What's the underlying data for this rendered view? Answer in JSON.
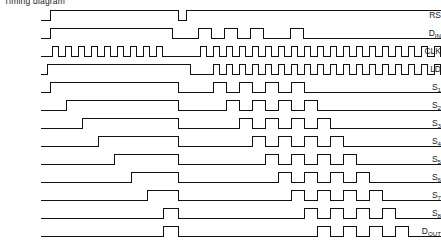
{
  "figure": {
    "caption": "Timing diagram",
    "width": 441,
    "height": 249,
    "stroke_color": "#111111",
    "background_color": "#ffffff"
  },
  "axis": {
    "plot_left": 41,
    "plot_right": 441,
    "row_height": 18,
    "wave_high": 4,
    "wave_low": 14,
    "clock_period": 13.1,
    "phase2_start": 178
  },
  "chart_data": {
    "type": "line",
    "title": "Timing diagram",
    "xlabel": "",
    "ylabel": "",
    "legend_position": "left-labels",
    "grid": false,
    "xlim": [
      41,
      441
    ],
    "ylim": [
      0,
      1
    ],
    "note": "Digital logic timing waveforms. Each series is a binary signal sampled as (x_pixel, level) transition pairs; level 1 = high, 0 = low.",
    "series": [
      {
        "name": "RS",
        "label": "RS",
        "overbar": true,
        "row": 0,
        "start_level": 0,
        "transitions": [
          [
            50,
            1
          ],
          [
            178,
            0
          ],
          [
            186,
            1
          ],
          [
            441,
            1
          ]
        ]
      },
      {
        "name": "D_IN",
        "label": "D",
        "sub": "IN",
        "overbar": false,
        "row": 1,
        "start_level": 0,
        "transitions": [
          [
            50,
            1
          ],
          [
            172,
            0
          ],
          [
            198,
            1
          ],
          [
            211,
            0
          ],
          [
            224,
            1
          ],
          [
            237,
            0
          ],
          [
            250,
            1
          ],
          [
            263,
            0
          ],
          [
            290,
            1
          ],
          [
            303,
            0
          ],
          [
            441,
            0
          ]
        ]
      },
      {
        "name": "CLK",
        "label": "CLK",
        "overbar": false,
        "row": 2,
        "start_level": 0,
        "transitions": [
          [
            52,
            1
          ],
          [
            58,
            0
          ],
          [
            65,
            1
          ],
          [
            71,
            0
          ],
          [
            78,
            1
          ],
          [
            84,
            0
          ],
          [
            91,
            1
          ],
          [
            97,
            0
          ],
          [
            104,
            1
          ],
          [
            110,
            0
          ],
          [
            117,
            1
          ],
          [
            123,
            0
          ],
          [
            130,
            1
          ],
          [
            136,
            0
          ],
          [
            143,
            1
          ],
          [
            149,
            0
          ],
          [
            156,
            1
          ],
          [
            162,
            0
          ],
          [
            200,
            1
          ],
          [
            206,
            0
          ],
          [
            213,
            1
          ],
          [
            219,
            0
          ],
          [
            226,
            1
          ],
          [
            232,
            0
          ],
          [
            239,
            1
          ],
          [
            245,
            0
          ],
          [
            252,
            1
          ],
          [
            258,
            0
          ],
          [
            265,
            1
          ],
          [
            271,
            0
          ],
          [
            278,
            1
          ],
          [
            284,
            0
          ],
          [
            291,
            1
          ],
          [
            297,
            0
          ],
          [
            304,
            1
          ],
          [
            310,
            0
          ],
          [
            317,
            1
          ],
          [
            323,
            0
          ],
          [
            330,
            1
          ],
          [
            336,
            0
          ],
          [
            343,
            1
          ],
          [
            349,
            0
          ],
          [
            356,
            1
          ],
          [
            362,
            0
          ],
          [
            369,
            1
          ],
          [
            375,
            0
          ],
          [
            382,
            1
          ],
          [
            388,
            0
          ],
          [
            395,
            1
          ],
          [
            401,
            0
          ],
          [
            408,
            1
          ],
          [
            414,
            0
          ],
          [
            421,
            1
          ],
          [
            427,
            0
          ],
          [
            434,
            1
          ],
          [
            440,
            0
          ],
          [
            441,
            0
          ]
        ]
      },
      {
        "name": "LD",
        "label": "LD",
        "overbar": false,
        "row": 3,
        "start_level": 0,
        "transitions": [
          [
            47,
            1
          ],
          [
            190,
            0
          ],
          [
            213,
            1
          ],
          [
            219,
            0
          ],
          [
            226,
            1
          ],
          [
            232,
            0
          ],
          [
            239,
            1
          ],
          [
            245,
            0
          ],
          [
            252,
            1
          ],
          [
            258,
            0
          ],
          [
            265,
            1
          ],
          [
            271,
            0
          ],
          [
            278,
            1
          ],
          [
            284,
            0
          ],
          [
            291,
            1
          ],
          [
            297,
            0
          ],
          [
            304,
            1
          ],
          [
            310,
            0
          ],
          [
            317,
            1
          ],
          [
            323,
            0
          ],
          [
            330,
            1
          ],
          [
            336,
            0
          ],
          [
            343,
            1
          ],
          [
            349,
            0
          ],
          [
            356,
            1
          ],
          [
            362,
            0
          ],
          [
            369,
            1
          ],
          [
            375,
            0
          ],
          [
            382,
            1
          ],
          [
            388,
            0
          ],
          [
            395,
            1
          ],
          [
            401,
            0
          ],
          [
            408,
            1
          ],
          [
            414,
            0
          ],
          [
            421,
            1
          ],
          [
            427,
            0
          ],
          [
            434,
            1
          ],
          [
            440,
            0
          ],
          [
            441,
            0
          ]
        ]
      },
      {
        "name": "S1",
        "label": "S",
        "sub": "1",
        "overbar": false,
        "row": 4,
        "start_level": 0,
        "transitions": [
          [
            50,
            1
          ],
          [
            178,
            0
          ],
          [
            213,
            1
          ],
          [
            226,
            0
          ],
          [
            239,
            1
          ],
          [
            252,
            0
          ],
          [
            265,
            1
          ],
          [
            278,
            0
          ],
          [
            291,
            1
          ],
          [
            304,
            0
          ],
          [
            441,
            0
          ]
        ]
      },
      {
        "name": "S2",
        "label": "S",
        "sub": "2",
        "overbar": false,
        "row": 5,
        "start_level": 0,
        "transitions": [
          [
            66,
            1
          ],
          [
            178,
            0
          ],
          [
            226,
            1
          ],
          [
            239,
            0
          ],
          [
            252,
            1
          ],
          [
            265,
            0
          ],
          [
            278,
            1
          ],
          [
            291,
            0
          ],
          [
            304,
            1
          ],
          [
            317,
            0
          ],
          [
            441,
            0
          ]
        ]
      },
      {
        "name": "S3",
        "label": "S",
        "sub": "3",
        "overbar": false,
        "row": 6,
        "start_level": 0,
        "transitions": [
          [
            82,
            1
          ],
          [
            178,
            0
          ],
          [
            239,
            1
          ],
          [
            252,
            0
          ],
          [
            265,
            1
          ],
          [
            278,
            0
          ],
          [
            291,
            1
          ],
          [
            304,
            0
          ],
          [
            317,
            1
          ],
          [
            330,
            0
          ],
          [
            441,
            0
          ]
        ]
      },
      {
        "name": "S4",
        "label": "S",
        "sub": "4",
        "overbar": false,
        "row": 7,
        "start_level": 0,
        "transitions": [
          [
            98,
            1
          ],
          [
            178,
            0
          ],
          [
            252,
            1
          ],
          [
            265,
            0
          ],
          [
            278,
            1
          ],
          [
            291,
            0
          ],
          [
            304,
            1
          ],
          [
            317,
            0
          ],
          [
            330,
            1
          ],
          [
            343,
            0
          ],
          [
            441,
            0
          ]
        ]
      },
      {
        "name": "S5",
        "label": "S",
        "sub": "5",
        "overbar": false,
        "row": 8,
        "start_level": 0,
        "transitions": [
          [
            114,
            1
          ],
          [
            178,
            0
          ],
          [
            265,
            1
          ],
          [
            278,
            0
          ],
          [
            291,
            1
          ],
          [
            304,
            0
          ],
          [
            317,
            1
          ],
          [
            330,
            0
          ],
          [
            343,
            1
          ],
          [
            356,
            0
          ],
          [
            441,
            0
          ]
        ]
      },
      {
        "name": "S6",
        "label": "S",
        "sub": "6",
        "overbar": false,
        "row": 9,
        "start_level": 0,
        "transitions": [
          [
            131,
            1
          ],
          [
            178,
            0
          ],
          [
            278,
            1
          ],
          [
            291,
            0
          ],
          [
            304,
            1
          ],
          [
            317,
            0
          ],
          [
            330,
            1
          ],
          [
            343,
            0
          ],
          [
            356,
            1
          ],
          [
            369,
            0
          ],
          [
            441,
            0
          ]
        ]
      },
      {
        "name": "S7",
        "label": "S",
        "sub": "7",
        "overbar": false,
        "row": 10,
        "start_level": 0,
        "transitions": [
          [
            147,
            1
          ],
          [
            178,
            0
          ],
          [
            291,
            1
          ],
          [
            304,
            0
          ],
          [
            317,
            1
          ],
          [
            330,
            0
          ],
          [
            343,
            1
          ],
          [
            356,
            0
          ],
          [
            369,
            1
          ],
          [
            382,
            0
          ],
          [
            441,
            0
          ]
        ]
      },
      {
        "name": "S8",
        "label": "S",
        "sub": "8",
        "overbar": false,
        "row": 11,
        "start_level": 0,
        "transitions": [
          [
            163,
            1
          ],
          [
            178,
            0
          ],
          [
            304,
            1
          ],
          [
            317,
            0
          ],
          [
            330,
            1
          ],
          [
            343,
            0
          ],
          [
            356,
            1
          ],
          [
            369,
            0
          ],
          [
            382,
            1
          ],
          [
            395,
            0
          ],
          [
            441,
            0
          ]
        ]
      },
      {
        "name": "D_OUT",
        "label": "D",
        "sub": "OUT",
        "overbar": false,
        "row": 12,
        "start_level": 0,
        "transitions": [
          [
            163,
            1
          ],
          [
            178,
            0
          ],
          [
            317,
            1
          ],
          [
            330,
            0
          ],
          [
            343,
            1
          ],
          [
            356,
            0
          ],
          [
            369,
            1
          ],
          [
            382,
            0
          ],
          [
            395,
            1
          ],
          [
            408,
            0
          ],
          [
            441,
            0
          ]
        ]
      }
    ]
  }
}
